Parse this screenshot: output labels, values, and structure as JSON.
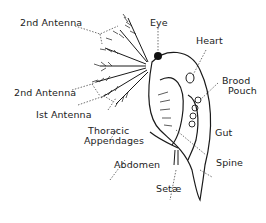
{
  "diagram": {
    "labels": {
      "antenna2_top": "2nd Antenna",
      "eye": "Eye",
      "heart": "Heart",
      "brood_pouch_1": "Brood",
      "brood_pouch_2": "Pouch",
      "antenna2_mid": "2nd Antenna",
      "antenna1": "Ist Antenna",
      "thoracic_1": "Thoracic",
      "thoracic_2": "Appendages",
      "gut": "Gut",
      "abdomen": "Abdomen",
      "spine": "Spine",
      "setae": "Setæ"
    },
    "colors": {
      "line": "#1a1a1a",
      "text": "#222222",
      "background": "#ffffff"
    }
  }
}
